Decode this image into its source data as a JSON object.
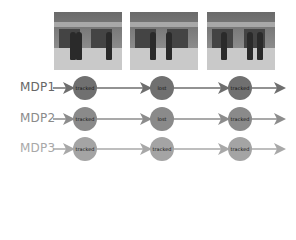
{
  "frames": [
    {
      "name": "frame-1",
      "people_x": [
        16,
        22,
        52
      ]
    },
    {
      "name": "frame-2",
      "people_x": [
        20,
        36
      ]
    },
    {
      "name": "frame-3",
      "people_x": [
        14,
        40,
        50
      ]
    }
  ],
  "rows": [
    {
      "label": "MDP1",
      "y": 88,
      "label_color": "#666666",
      "line_color": "#6e6e6e",
      "node_color": "#707070",
      "states": [
        "tracked",
        "lost",
        "tracked"
      ]
    },
    {
      "label": "MDP2",
      "y": 119,
      "label_color": "#8a8a8a",
      "line_color": "#8c8c8c",
      "node_color": "#8a8a8a",
      "states": [
        "tracked",
        "lost",
        "tracked"
      ]
    },
    {
      "label": "MDP3",
      "y": 149,
      "label_color": "#a8a8a8",
      "line_color": "#a8a8a8",
      "node_color": "#a4a4a4",
      "states": [
        "tracked",
        "tracked",
        "tracked"
      ]
    }
  ],
  "node_x": [
    85,
    162,
    240
  ],
  "frame_x": [
    54,
    130,
    207
  ]
}
